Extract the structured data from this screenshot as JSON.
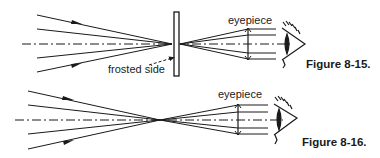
{
  "figures": [
    {
      "caption": "Figure 8-15.",
      "labels": {
        "eyepiece": "eyepiece",
        "frosted_side": "frosted side"
      }
    },
    {
      "caption": "Figure 8-16.",
      "labels": {
        "eyepiece": "eyepiece"
      }
    }
  ],
  "colors": {
    "ink": "#1a1a1a",
    "background": "#ffffff"
  }
}
